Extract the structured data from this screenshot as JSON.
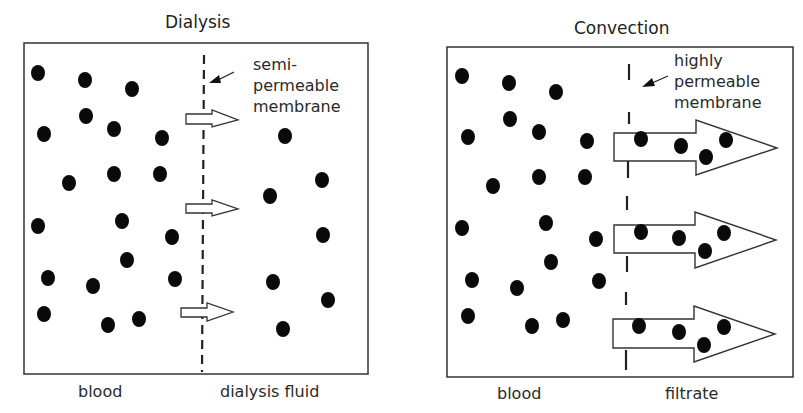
{
  "panels": {
    "dialysis": {
      "title": "Dialysis",
      "membrane_label": [
        "semi-",
        "permeable",
        "membrane"
      ],
      "left_label": "blood",
      "right_label": "dialysis fluid"
    },
    "convection": {
      "title": "Convection",
      "membrane_label": [
        "highly",
        "permeable",
        "membrane"
      ],
      "left_label": "blood",
      "right_label": "filtrate"
    }
  }
}
